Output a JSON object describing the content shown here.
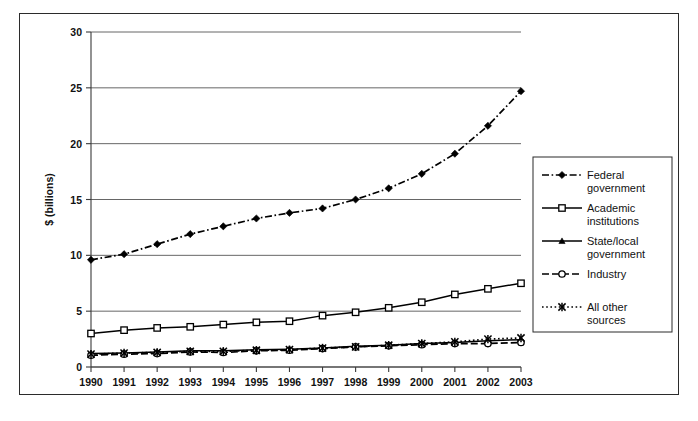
{
  "chart_data": {
    "type": "line",
    "title": "",
    "xlabel": "year",
    "ylabel": "$ (billions)",
    "xlim": [
      1990,
      2003
    ],
    "ylim": [
      0,
      30
    ],
    "yticks": [
      0,
      5,
      10,
      15,
      20,
      25,
      30
    ],
    "grid": true,
    "legend_position": "right",
    "categories": [
      "1990",
      "1991",
      "1992",
      "1993",
      "1994",
      "1995",
      "1996",
      "1997",
      "1998",
      "1999",
      "2000",
      "2001",
      "2002",
      "2003"
    ],
    "x": [
      1990,
      1991,
      1992,
      1993,
      1994,
      1995,
      1996,
      1997,
      1998,
      1999,
      2000,
      2001,
      2002,
      2003
    ],
    "series": [
      {
        "name": "Federal government",
        "label_line1": "Federal",
        "label_line2": "government",
        "marker": "diamond",
        "linestyle": "dashdot",
        "color": "#000000",
        "values": [
          9.6,
          10.1,
          11.0,
          11.9,
          12.6,
          13.3,
          13.8,
          14.2,
          15.0,
          16.0,
          17.3,
          19.1,
          21.6,
          24.7
        ]
      },
      {
        "name": "Academic institutions",
        "label_line1": "Academic",
        "label_line2": "institutions",
        "marker": "open-square",
        "linestyle": "solid",
        "color": "#000000",
        "values": [
          3.0,
          3.3,
          3.5,
          3.6,
          3.8,
          4.0,
          4.1,
          4.6,
          4.9,
          5.3,
          5.8,
          6.5,
          7.0,
          7.5
        ]
      },
      {
        "name": "State/local government",
        "label_line1": "State/local",
        "label_line2": "government",
        "marker": "triangle",
        "linestyle": "solid",
        "color": "#000000",
        "values": [
          1.2,
          1.25,
          1.35,
          1.45,
          1.45,
          1.55,
          1.6,
          1.7,
          1.85,
          1.95,
          2.1,
          2.2,
          2.35,
          2.45
        ]
      },
      {
        "name": "Industry",
        "label_line1": "Industry",
        "label_line2": "",
        "marker": "open-circle",
        "linestyle": "dashed",
        "color": "#000000",
        "values": [
          1.05,
          1.15,
          1.2,
          1.35,
          1.3,
          1.45,
          1.5,
          1.65,
          1.8,
          1.9,
          2.0,
          2.1,
          2.1,
          2.2
        ]
      },
      {
        "name": "All other sources",
        "label_line1": "All other",
        "label_line2": "sources",
        "marker": "star-x",
        "linestyle": "dotted",
        "color": "#000000",
        "values": [
          1.15,
          1.25,
          1.3,
          1.4,
          1.4,
          1.5,
          1.55,
          1.7,
          1.8,
          1.95,
          2.1,
          2.25,
          2.5,
          2.6
        ]
      }
    ]
  },
  "axis": {
    "y_title": "$ (billions)",
    "x_title": "year",
    "y_tick_labels": [
      "0",
      "5",
      "10",
      "15",
      "20",
      "25",
      "30"
    ],
    "x_tick_labels": [
      "1990",
      "1991",
      "1992",
      "1993",
      "1994",
      "1995",
      "1996",
      "1997",
      "1998",
      "1999",
      "2000",
      "2001",
      "2002",
      "2003"
    ]
  },
  "legend": {
    "entries": [
      {
        "line1": "Federal",
        "line2": "government"
      },
      {
        "line1": "Academic",
        "line2": "institutions"
      },
      {
        "line1": "State/local",
        "line2": "government"
      },
      {
        "line1": "Industry",
        "line2": ""
      },
      {
        "line1": "All other",
        "line2": "sources"
      }
    ]
  }
}
